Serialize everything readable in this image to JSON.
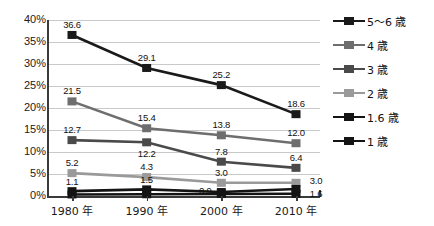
{
  "chart_data": {
    "type": "line",
    "title": "",
    "xlabel": "",
    "ylabel": "",
    "categories": [
      "1980 年",
      "1990 年",
      "2000 年",
      "2010 年"
    ],
    "ylim": [
      0,
      40
    ],
    "ytick_labels": [
      "0%",
      "5%",
      "10%",
      "15%",
      "20%",
      "25%",
      "30%",
      "35%",
      "40%"
    ],
    "ytick_values": [
      0,
      5,
      10,
      15,
      20,
      25,
      30,
      35,
      40
    ],
    "grid": true,
    "legend_position": "right",
    "series": [
      {
        "name": "5〜6 歳",
        "color": "#1a1a1a",
        "values": [
          36.6,
          29.1,
          25.2,
          18.6
        ],
        "labels": [
          "36.6",
          "29.1",
          "25.2",
          "18.6"
        ],
        "label_offsets": [
          [
            0,
            -11
          ],
          [
            0,
            -11
          ],
          [
            0,
            -11
          ],
          [
            0,
            -11
          ]
        ]
      },
      {
        "name": "4 歳",
        "color": "#6e6e6e",
        "values": [
          21.5,
          15.4,
          13.8,
          12.0
        ],
        "labels": [
          "21.5",
          "15.4",
          "13.8",
          "12.0"
        ],
        "label_offsets": [
          [
            0,
            -11
          ],
          [
            0,
            -11
          ],
          [
            0,
            -11
          ],
          [
            0,
            -11
          ]
        ]
      },
      {
        "name": "3 歳",
        "color": "#4a4a4a",
        "values": [
          12.7,
          12.2,
          7.8,
          6.4
        ],
        "labels": [
          "12.7",
          "12.2",
          "7.8",
          "6.4"
        ],
        "label_offsets": [
          [
            0,
            -11
          ],
          [
            0,
            11
          ],
          [
            0,
            -11
          ],
          [
            0,
            -11
          ]
        ]
      },
      {
        "name": "2 歳",
        "color": "#9a9a9a",
        "values": [
          5.2,
          4.3,
          3.0,
          3.0
        ],
        "labels": [
          "5.2",
          "4.3",
          "3.0",
          "3.0"
        ],
        "label_offsets": [
          [
            0,
            -11
          ],
          [
            0,
            -11
          ],
          [
            0,
            -11
          ],
          [
            20,
            -3
          ]
        ]
      },
      {
        "name": "1.6 歳",
        "color": "#141414",
        "values": [
          1.1,
          1.5,
          0.9,
          1.6
        ],
        "labels": [
          "1.1",
          "1.5",
          "0.9",
          "1.6"
        ],
        "label_offsets": [
          [
            0,
            -10
          ],
          [
            0,
            -10
          ],
          [
            -16,
            -2
          ],
          [
            20,
            4
          ]
        ]
      },
      {
        "name": "1 歳",
        "color": "#141414",
        "values": [
          0.35,
          0.4,
          0.45,
          0.5
        ],
        "labels": [
          "",
          "",
          "",
          ""
        ],
        "label_offsets": [
          [
            0,
            0
          ],
          [
            0,
            0
          ],
          [
            0,
            0
          ],
          [
            0,
            0
          ]
        ]
      }
    ]
  },
  "legend": {
    "items": [
      {
        "label": "5〜6 歳",
        "color": "#1a1a1a"
      },
      {
        "label": "4 歳",
        "color": "#6e6e6e"
      },
      {
        "label": "3 歳",
        "color": "#4a4a4a"
      },
      {
        "label": "2 歳",
        "color": "#9a9a9a"
      },
      {
        "label": "1.6 歳",
        "color": "#141414"
      },
      {
        "label": "1 歳",
        "color": "#141414"
      }
    ]
  },
  "colors": {
    "background": "#ffffff",
    "gridline": "#c9c9c9",
    "axis": "#3a3a3a",
    "text": "#1a1a1a"
  }
}
